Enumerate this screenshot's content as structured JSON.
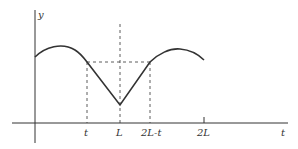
{
  "diagram": {
    "axes": {
      "y_label": "y",
      "x_label": "t"
    },
    "tick_labels": [
      "t",
      "L",
      "2L-t",
      "2L"
    ],
    "colors": {
      "line": "#333333",
      "background": "#ffffff"
    }
  }
}
